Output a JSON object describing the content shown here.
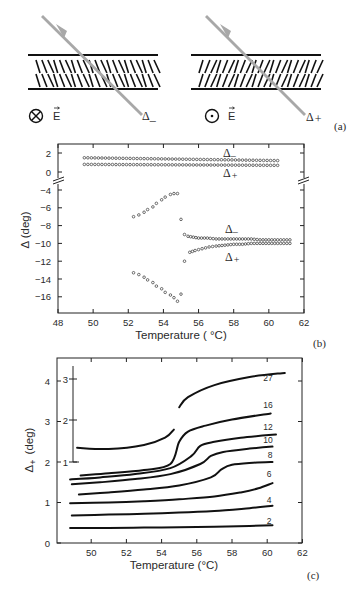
{
  "figure": {
    "panel_a": {
      "label": "(a)",
      "left_cell": {
        "field_symbol": "⊗",
        "field_label": "E",
        "beam_label": "Δ",
        "beam_subscript": "_",
        "molecule_tilt": "backslash"
      },
      "right_cell": {
        "field_symbol": "⊙",
        "field_label": "E",
        "beam_label": "Δ",
        "beam_subscript": "+",
        "molecule_tilt": "slash"
      },
      "beam_color": "#a8a8a8"
    },
    "panel_b": {
      "label": "(b)",
      "xlabel": "Temperature ( °C)",
      "ylabel": "Δ (deg)",
      "annotations": [
        {
          "text": "Δ",
          "sub": "_",
          "pos": "upper-top"
        },
        {
          "text": "Δ",
          "sub": "+",
          "pos": "upper-bottom"
        },
        {
          "text": "Δ",
          "sub": "_",
          "pos": "lower-top"
        },
        {
          "text": "Δ",
          "sub": "+",
          "pos": "lower-bottom"
        }
      ]
    },
    "panel_c": {
      "label": "(c)",
      "xlabel": "Temperature (°C)",
      "ylabel": "Δ+ (deg)",
      "ylabel_main": "Δ",
      "ylabel_sub": "+",
      "ylabel_unit": "(deg)",
      "inset_axis_ticks": [
        "3",
        "2",
        "1"
      ],
      "curve_labels": [
        "27",
        "16",
        "12",
        "10",
        "8",
        "6",
        "4",
        "2"
      ]
    }
  },
  "chart_data": [
    {
      "type": "scatter",
      "panel": "b",
      "title": "",
      "xlabel": "Temperature ( °C)",
      "ylabel": "Δ (deg)",
      "xlim": [
        48,
        62
      ],
      "ylim": [
        -18,
        3
      ],
      "broken_y_axis": {
        "between": [
          0,
          -4
        ]
      },
      "xticks": [
        "48",
        "50",
        "52",
        "54",
        "56",
        "58",
        "60",
        "62"
      ],
      "yticks": [
        "2",
        "0",
        "-4",
        "-6",
        "-8",
        "-10",
        "-12",
        "-14",
        "-16"
      ],
      "grid": false,
      "series": [
        {
          "name": "Δ_ (high field, upper)",
          "x_range": [
            49.5,
            60.5
          ],
          "y_start": 1.5,
          "y_end": 1.2
        },
        {
          "name": "Δ+ (high field, upper)",
          "x_range": [
            49.5,
            60.5
          ],
          "y_start": 0.8,
          "y_end": 0.7
        },
        {
          "name": "Δ_ (low field)",
          "x": [
            52.3,
            52.6,
            52.9,
            53.1,
            53.4,
            53.6,
            53.9,
            54.1,
            54.4,
            54.6,
            54.8,
            55.0,
            55.2,
            55.4,
            55.7,
            56.0,
            56.5,
            57,
            57.5,
            58,
            58.5,
            59,
            59.5,
            60,
            60.5,
            61.2
          ],
          "y": [
            -7.0,
            -6.8,
            -6.5,
            -6.2,
            -5.9,
            -5.5,
            -5.1,
            -4.8,
            -4.5,
            -4.4,
            -4.4,
            -7.3,
            -9.0,
            -9.2,
            -9.3,
            -9.4,
            -9.4,
            -9.5,
            -9.5,
            -9.5,
            -9.5,
            -9.5,
            -9.6,
            -9.6,
            -9.6,
            -9.6
          ]
        },
        {
          "name": "Δ+ (low field)",
          "x": [
            52.3,
            52.6,
            52.9,
            53.1,
            53.4,
            53.6,
            53.9,
            54.1,
            54.4,
            54.6,
            54.8,
            55.0,
            55.2,
            55.5,
            55.8,
            56.2,
            56.6,
            57,
            57.5,
            58,
            58.5,
            59,
            59.5,
            60,
            60.5,
            61.2
          ],
          "y": [
            -13.3,
            -13.5,
            -13.8,
            -14.1,
            -14.4,
            -14.8,
            -15.1,
            -15.5,
            -15.8,
            -16.1,
            -16.5,
            -15.7,
            -12.0,
            -11.0,
            -10.8,
            -10.6,
            -10.4,
            -10.3,
            -10.2,
            -10.1,
            -10.1,
            -10.0,
            -10.0,
            -10.0,
            -10.0,
            -10.0
          ]
        }
      ]
    },
    {
      "type": "line",
      "panel": "c",
      "title": "",
      "xlabel": "Temperature (°C)",
      "ylabel": "Δ+ (deg)",
      "xlim": [
        48,
        62
      ],
      "ylim": [
        0,
        4.4
      ],
      "xticks": [
        "50",
        "52",
        "54",
        "56",
        "58",
        "60",
        "62"
      ],
      "yticks": [
        "0",
        "1",
        "2",
        "3",
        "4"
      ],
      "inset_yticks": [
        "1",
        "2",
        "3"
      ],
      "grid": false,
      "series": [
        {
          "name": "27",
          "x": [
            49.2,
            51,
            53,
            54.2,
            54.7,
            55.0,
            55.5,
            57,
            59,
            61.0
          ],
          "y_inset": [
            1.4,
            1.35,
            1.4,
            1.55,
            1.8
          ],
          "y": [
            2.35,
            2.32,
            2.42,
            2.6,
            2.8,
            3.35,
            3.6,
            3.9,
            4.1,
            4.2
          ]
        },
        {
          "name": "16",
          "x": [
            49.4,
            51,
            53,
            54.5,
            55.0,
            55.5,
            56.5,
            58,
            60.2
          ],
          "y": [
            1.67,
            1.72,
            1.8,
            1.95,
            2.5,
            2.75,
            2.9,
            3.05,
            3.2
          ]
        },
        {
          "name": "12",
          "x": [
            48.8,
            50.5,
            52.5,
            54.5,
            55.7,
            56.2,
            57,
            58.5,
            60.5
          ],
          "y": [
            1.57,
            1.62,
            1.7,
            1.85,
            2.15,
            2.4,
            2.5,
            2.6,
            2.68
          ]
        },
        {
          "name": "10",
          "x": [
            48.9,
            50.5,
            52.5,
            54.5,
            56.2,
            56.8,
            57.5,
            59,
            60.3
          ],
          "y": [
            1.45,
            1.5,
            1.58,
            1.7,
            1.95,
            2.15,
            2.25,
            2.33,
            2.38
          ]
        },
        {
          "name": "8",
          "x": [
            49.3,
            51,
            53,
            55,
            56.8,
            57.4,
            58,
            59.2,
            60.3
          ],
          "y": [
            1.2,
            1.25,
            1.32,
            1.42,
            1.62,
            1.82,
            1.93,
            1.98,
            2.0
          ]
        },
        {
          "name": "6",
          "x": [
            48.8,
            51,
            53,
            55,
            57,
            58.5,
            59.5,
            60.3
          ],
          "y": [
            0.98,
            1.0,
            1.03,
            1.08,
            1.15,
            1.25,
            1.35,
            1.48
          ]
        },
        {
          "name": "4",
          "x": [
            48.9,
            51,
            53,
            55,
            57,
            59,
            60.3
          ],
          "y": [
            0.68,
            0.7,
            0.72,
            0.75,
            0.79,
            0.86,
            0.92
          ]
        },
        {
          "name": "2",
          "x": [
            48.8,
            51,
            53,
            55,
            57,
            59,
            60.3
          ],
          "y": [
            0.37,
            0.37,
            0.38,
            0.39,
            0.4,
            0.42,
            0.44
          ]
        }
      ]
    }
  ]
}
